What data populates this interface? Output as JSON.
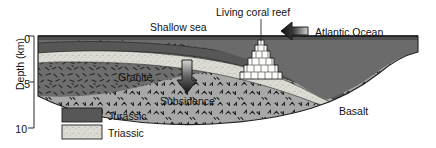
{
  "figure": {
    "type": "geological-cross-section",
    "title_labels": {
      "shallow_sea": "Shallow sea",
      "living_coral_reef": "Living coral reef",
      "atlantic_ocean": "Atlantic Ocean",
      "granite": "Granite",
      "subsidence": "Subsidence",
      "basalt": "Basalt"
    },
    "axis": {
      "label": "Depth (km)",
      "ticks": [
        "0",
        "5",
        "10"
      ],
      "tick_values": [
        0,
        5,
        10
      ],
      "range": [
        0,
        10
      ],
      "orientation": "vertical-inverted"
    },
    "legend": {
      "items": [
        {
          "label": "Jurassic",
          "swatch": "dark-gray-solid",
          "color": "#575757"
        },
        {
          "label": "Triassic",
          "swatch": "light-stippled",
          "color": "#d9d9d1"
        }
      ]
    },
    "arrows": [
      {
        "name": "ocean-direction-arrow",
        "direction": "left",
        "style": "3d-block"
      },
      {
        "name": "subsidence-arrow",
        "direction": "down",
        "style": "3d-block"
      }
    ],
    "units": {
      "sea_water": "#6b6b6b",
      "jurassic": "#575757",
      "triassic": "#d9d9d1",
      "granite": "#6e6e6e",
      "basalt": "#a8a8a8",
      "coral_reef": "#fdfdfd"
    }
  }
}
